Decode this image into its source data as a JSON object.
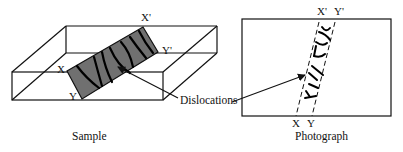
{
  "sample": {
    "caption": "Sample",
    "labels": {
      "x": "X",
      "y": "Y",
      "x_prime": "X'",
      "y_prime": "Y'"
    }
  },
  "photograph": {
    "caption": "Photograph",
    "labels": {
      "x": "X",
      "y": "Y",
      "x_prime": "X'",
      "y_prime": "Y'"
    }
  },
  "callout": {
    "label": "Dislocations"
  },
  "colors": {
    "plate_fill": "#707070",
    "line": "#111111",
    "background": "#ffffff"
  }
}
